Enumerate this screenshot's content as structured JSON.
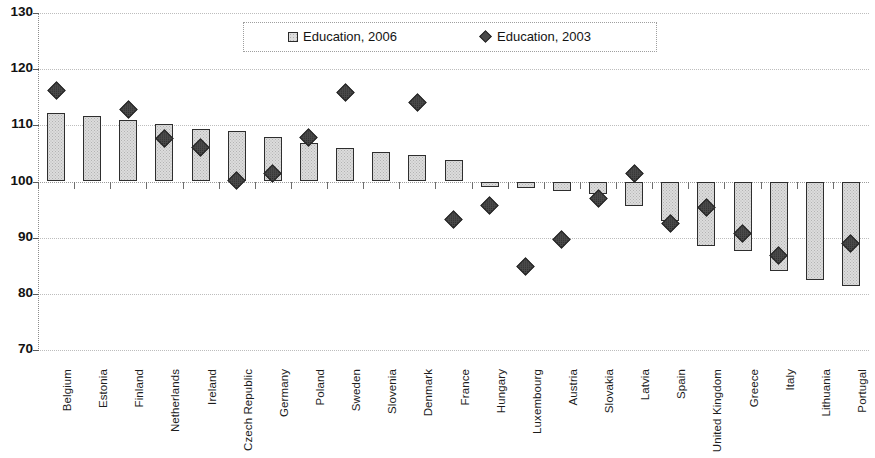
{
  "chart_data": {
    "type": "bar",
    "title": "",
    "subtitle": "",
    "xlabel": "",
    "ylabel": "",
    "ylim": [
      70,
      130
    ],
    "y_ticks": [
      130,
      120,
      110,
      100,
      90,
      80,
      70
    ],
    "grid": true,
    "baseline": 100,
    "legend_position": "top-center",
    "categories": [
      "Belgium",
      "Estonia",
      "Finland",
      "Netherlands",
      "Ireland",
      "Czech Republic",
      "Germany",
      "Poland",
      "Sweden",
      "Slovenia",
      "Denmark",
      "France",
      "Hungary",
      "Luxembourg",
      "Austria",
      "Slovakia",
      "Latvia",
      "Spain",
      "United Kingdom",
      "Greece",
      "Italy",
      "Lithuania",
      "Portugal"
    ],
    "series": [
      {
        "name": "Education, 2006",
        "marker": "square",
        "render": "bar",
        "values": [
          112.2,
          111.7,
          111.0,
          110.2,
          109.4,
          109.0,
          107.9,
          106.8,
          106.0,
          105.3,
          104.8,
          103.9,
          99.0,
          98.8,
          98.3,
          97.8,
          95.6,
          93.0,
          88.6,
          87.6,
          84.0,
          82.5,
          81.4
        ]
      },
      {
        "name": "Education, 2003",
        "marker": "diamond",
        "render": "point",
        "values": [
          116.2,
          null,
          112.8,
          107.7,
          106.1,
          100.2,
          101.4,
          107.9,
          115.8,
          null,
          114.0,
          93.3,
          95.7,
          84.8,
          89.7,
          97.0,
          101.5,
          92.5,
          95.3,
          90.8,
          86.9,
          null,
          88.9
        ]
      }
    ]
  },
  "legend": {
    "entries": [
      {
        "label": "Education, 2006",
        "icon": "legend-square-icon"
      },
      {
        "label": "Education, 2003",
        "icon": "legend-diamond-icon"
      }
    ]
  },
  "axes": {
    "y_tick_labels": [
      "130",
      "120",
      "110",
      "100",
      "90",
      "80",
      "70"
    ]
  },
  "colors": {
    "bar_fill": "#dcdcdc",
    "bar_border": "#2e2e2e",
    "marker_fill": "#4a4a4a",
    "marker_border": "#232323",
    "gridline": "#bdbdbd",
    "text": "#1a1a1a",
    "background": "#ffffff"
  }
}
